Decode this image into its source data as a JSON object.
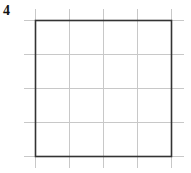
{
  "question": {
    "number": "4"
  },
  "diagram": {
    "type": "grid-with-square",
    "grid": {
      "columns": 4,
      "rows": 4,
      "line_color": "#c8c8c8"
    },
    "shape": {
      "kind": "square",
      "side_units": 4,
      "stroke_color": "#333333"
    }
  }
}
